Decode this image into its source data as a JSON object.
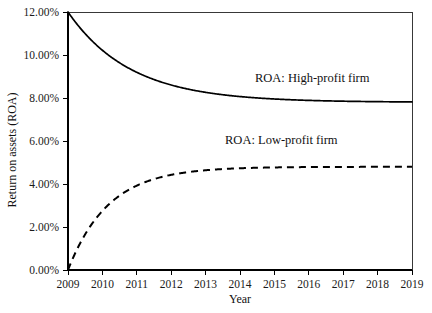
{
  "chart_data": {
    "type": "line",
    "title": "",
    "xlabel": "Year",
    "ylabel": "Return on assets (ROA)",
    "xlim": [
      2009,
      2019
    ],
    "ylim": [
      0,
      12
    ],
    "grid": false,
    "legend_position": "inline-annotation",
    "x": [
      2009,
      2010,
      2011,
      2012,
      2013,
      2014,
      2015,
      2016,
      2017,
      2018,
      2019
    ],
    "xtick_labels": [
      "2009",
      "2010",
      "2011",
      "2012",
      "2013",
      "2014",
      "2015",
      "2016",
      "2017",
      "2018",
      "2019"
    ],
    "ytick_values": [
      0,
      2,
      4,
      6,
      8,
      10,
      12
    ],
    "ytick_labels": [
      "0.00%",
      "2.00%",
      "4.00%",
      "6.00%",
      "8.00%",
      "10.00%",
      "12.00%"
    ],
    "series": [
      {
        "name": "ROA: High-profit firm",
        "style": "solid",
        "color": "#000000",
        "asymptote": 7.8,
        "start_value": 12.0,
        "values": [
          12.0,
          10.22,
          9.19,
          8.6,
          8.26,
          8.06,
          7.95,
          7.89,
          7.85,
          7.82,
          7.81
        ]
      },
      {
        "name": "ROA: Low-profit firm",
        "style": "dashed",
        "color": "#000000",
        "asymptote": 4.8,
        "start_value": 0.0,
        "values": [
          0.0,
          2.75,
          3.75,
          4.37,
          4.6,
          4.71,
          4.76,
          4.78,
          4.79,
          4.795,
          4.8
        ]
      }
    ],
    "annotations": [
      {
        "text": "ROA: High-profit firm",
        "x": 2016.1,
        "y": 8.75
      },
      {
        "text": "ROA: Low-profit firm",
        "x": 2015.2,
        "y": 5.85
      }
    ]
  }
}
